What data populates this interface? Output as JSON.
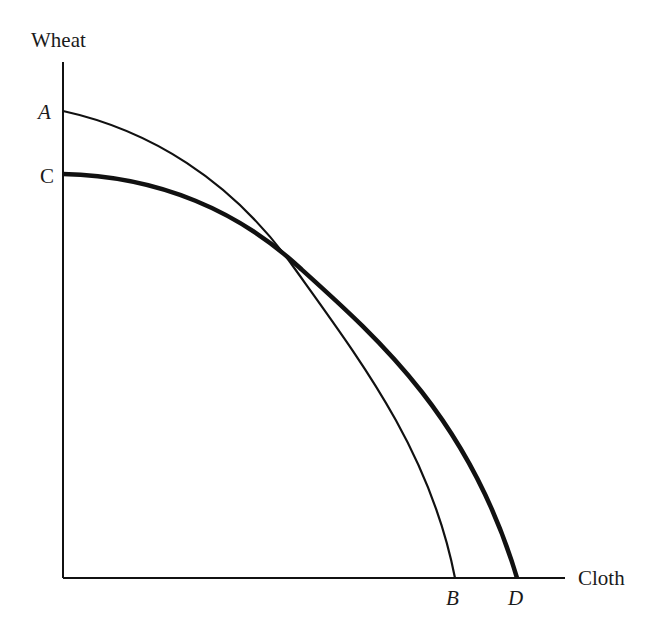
{
  "diagram": {
    "type": "production-possibility-frontier",
    "y_axis_label": "Wheat",
    "x_axis_label": "Cloth",
    "points": {
      "A": "A",
      "B": "B",
      "C": "C",
      "D": "D"
    },
    "curves": [
      {
        "name": "AB",
        "from": "A",
        "to": "B",
        "style": "thin"
      },
      {
        "name": "CD",
        "from": "C",
        "to": "D",
        "style": "thick"
      }
    ]
  },
  "colors": {
    "stroke": "#111111",
    "background": "#ffffff"
  }
}
